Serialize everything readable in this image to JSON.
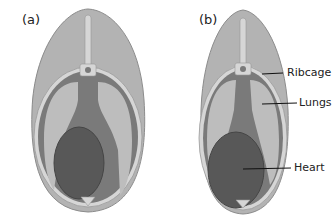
{
  "panels": [
    {
      "label": "(a)"
    },
    {
      "label": "(b)"
    }
  ],
  "callouts": {
    "ribcage": "Ribcage",
    "lungs": "Lungs",
    "heart": "Heart"
  },
  "colors": {
    "body": "#b3b3b3",
    "body_outline": "#8c8c8c",
    "rib": "#d6d6d6",
    "lung": "#bdbdbd",
    "mediastinum": "#7a7a7a",
    "heart": "#585858",
    "heart_outline": "#454545"
  }
}
